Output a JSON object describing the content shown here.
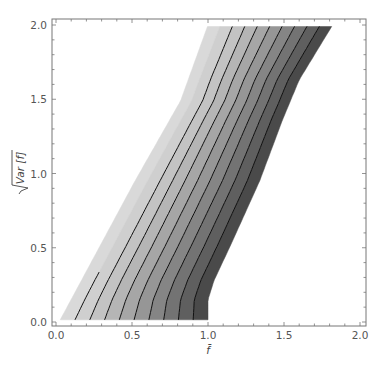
{
  "chart_data": {
    "type": "contour",
    "title": "",
    "xlabel": "f̄",
    "ylabel": "√Var[f]",
    "xlim": [
      0.0,
      2.0
    ],
    "ylim": [
      0.0,
      2.0
    ],
    "grid": false,
    "legend": null,
    "x_ticks": [
      "0.0",
      "0.5",
      "1.0",
      "1.5",
      "2.0"
    ],
    "y_ticks": [
      "0.0",
      "0.5",
      "1.0",
      "1.5",
      "2.0"
    ],
    "num_bands": 10,
    "band_colors": [
      "#d9d9d9",
      "#cfcfcf",
      "#c3c3c3",
      "#b5b5b5",
      "#a6a6a6",
      "#969696",
      "#858585",
      "#737373",
      "#5f5f5f",
      "#4a4a4a"
    ],
    "contour_color": "#111111",
    "left_boundary": [
      [
        0.02,
        0.0
      ],
      [
        0.52,
        0.95
      ],
      [
        0.82,
        1.49
      ],
      [
        1.0,
        2.0
      ]
    ],
    "right_boundary": [
      [
        1.0,
        0.0
      ],
      [
        1.0,
        0.15
      ],
      [
        1.04,
        0.28
      ],
      [
        1.15,
        0.52
      ],
      [
        1.34,
        0.95
      ],
      [
        1.49,
        1.36
      ],
      [
        1.6,
        1.63
      ],
      [
        1.82,
        2.0
      ]
    ],
    "contour_levels_at_bottom": [
      0.1,
      0.2,
      0.3,
      0.4,
      0.5,
      0.6,
      0.7,
      0.8,
      0.9
    ],
    "first_contour_max_y": 0.36
  },
  "axes": {
    "x_label": "f̄",
    "y_label_radicand": "Var [f]",
    "x_tick_labels": [
      "0.0",
      "0.5",
      "1.0",
      "1.5",
      "2.0"
    ],
    "y_tick_labels": [
      "0.0",
      "0.5",
      "1.0",
      "1.5",
      "2.0"
    ]
  }
}
